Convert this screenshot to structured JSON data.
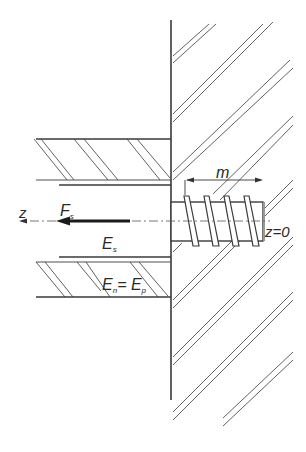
{
  "diagram": {
    "type": "technical-cross-section",
    "labels": {
      "z_axis": "z",
      "force": "F",
      "force_sub": "s",
      "screw_modulus": "E",
      "screw_modulus_sub": "s",
      "plate_modulus_left": "E",
      "plate_modulus_left_sub": "n",
      "equals": "= ",
      "plate_modulus_right": "E",
      "plate_modulus_right_sub": "p",
      "length": "m",
      "origin": "z=0"
    },
    "colors": {
      "stroke": "#2a2a2a",
      "hatch": "#4a4a4a",
      "background": "#ffffff"
    }
  }
}
